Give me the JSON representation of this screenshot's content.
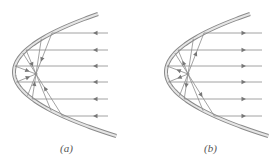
{
  "figure": {
    "panels": [
      {
        "id": "a",
        "label": "(a)",
        "ray_direction": "incoming-toward-mirror",
        "arrow_direction": "left",
        "mirror": {
          "vertex": [
            14,
            72
          ],
          "top": [
            98,
            14
          ],
          "bottom": [
            98,
            136
          ]
        },
        "focus": [
          36,
          74
        ],
        "ray_ys": [
          33,
          50,
          66,
          82,
          99,
          116
        ],
        "ray_far_x": 108,
        "arrow_x": 93
      },
      {
        "id": "b",
        "label": "(b)",
        "ray_direction": "outgoing-from-mirror",
        "arrow_direction": "right",
        "mirror": {
          "vertex": [
            166,
            72
          ],
          "top": [
            250,
            14
          ],
          "bottom": [
            250,
            136
          ]
        },
        "focus": [
          188,
          74
        ],
        "ray_ys": [
          33,
          50,
          66,
          82,
          99,
          116
        ],
        "ray_far_x": 262,
        "arrow_x": 246
      }
    ]
  },
  "colors": {
    "mirror_outer": "#8a8a8a",
    "mirror_inner": "#e6e6e6",
    "ray": "#8c8c8c",
    "arrow": "#777777",
    "label": "#555555"
  }
}
